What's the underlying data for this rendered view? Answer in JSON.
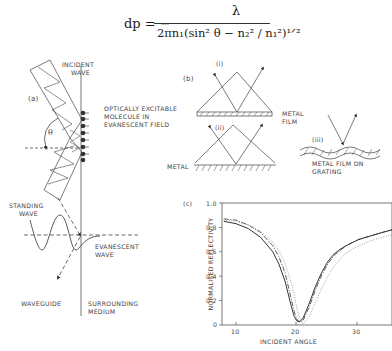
{
  "equation": {
    "lhs": "dp = −",
    "numerator": "λ",
    "denominator": "2πn₁(sin² θ − n₂² / n₁²)¹ᐟ²"
  },
  "panel_a": {
    "label": "(a)",
    "incident_wave": [
      "INCIDENT",
      "WAVE"
    ],
    "theta": "θ",
    "molecule": [
      "OPTICALLY EXCITABLE",
      "MOLECULE IN",
      "EVANESCENT FIELD"
    ],
    "standing_wave": [
      "STANDING",
      "WAVE"
    ],
    "evanescent_wave": [
      "EVANESCENT",
      "WAVE"
    ],
    "waveguide": "WAVEGUIDE",
    "surrounding_medium": [
      "SURROUNDING",
      "MEDIUM"
    ]
  },
  "panel_b": {
    "label": "(b)",
    "sub_i": "(i)",
    "sub_ii": "(ii)",
    "sub_iii": "(iii)",
    "metal_film": [
      "METAL",
      "FILM"
    ],
    "metal": "METAL",
    "grating": [
      "METAL FILM ON",
      "GRATING"
    ]
  },
  "panel_c": {
    "label": "(c)"
  },
  "chart_data": {
    "type": "line",
    "title": "",
    "xlabel": "INCIDENT ANGLE",
    "ylabel": "NORMALISED REFLECTIVITY",
    "xlim": [
      7.7,
      35.5
    ],
    "ylim": [
      0,
      1.0
    ],
    "xticks": [
      10,
      20,
      30
    ],
    "yticks": [
      0,
      0.2,
      0.4,
      0.6,
      0.8,
      1.0
    ],
    "ytick_labels": [
      "0",
      "0.2",
      "0.4",
      "0.6",
      "0.8",
      "1.0"
    ],
    "grid": false,
    "legend": null,
    "x": [
      8,
      10,
      12,
      14,
      16,
      17,
      18,
      19,
      19.5,
      20,
      20.5,
      21,
      22,
      23,
      24,
      25,
      26,
      27,
      28,
      30,
      32,
      34,
      35.5
    ],
    "series": [
      {
        "name": "solid",
        "style": "solid",
        "values": [
          0.85,
          0.83,
          0.79,
          0.72,
          0.6,
          0.5,
          0.36,
          0.16,
          0.07,
          0.03,
          0.03,
          0.06,
          0.18,
          0.32,
          0.43,
          0.52,
          0.58,
          0.62,
          0.65,
          0.7,
          0.73,
          0.76,
          0.78
        ]
      },
      {
        "name": "dash-dot",
        "style": "dashdot",
        "values": [
          0.87,
          0.86,
          0.82,
          0.76,
          0.65,
          0.56,
          0.43,
          0.22,
          0.11,
          0.04,
          0.02,
          0.04,
          0.15,
          0.29,
          0.41,
          0.5,
          0.57,
          0.61,
          0.65,
          0.7,
          0.73,
          0.76,
          0.78
        ]
      },
      {
        "name": "dotted",
        "style": "dotted",
        "values": [
          0.86,
          0.85,
          0.82,
          0.77,
          0.68,
          0.61,
          0.51,
          0.35,
          0.25,
          0.12,
          0.05,
          0.01,
          0.07,
          0.19,
          0.3,
          0.4,
          0.48,
          0.54,
          0.59,
          0.65,
          0.69,
          0.72,
          0.74
        ]
      }
    ]
  }
}
